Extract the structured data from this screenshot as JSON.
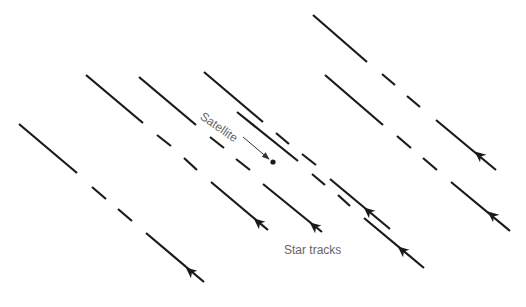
{
  "diagram": {
    "labels": {
      "satellite": "Satellite",
      "star_tracks": "Star tracks"
    },
    "colors": {
      "track": "#1a1a1a",
      "label": "#666666",
      "pointer": "#333333",
      "background": "#ffffff"
    },
    "star_tracks": [
      {
        "id": "A",
        "segments": [
          [
            19,
            124,
            77,
            173
          ],
          [
            92,
            187,
            106,
            199
          ],
          [
            118,
            209,
            132,
            221
          ],
          [
            146,
            233,
            204,
            282
          ]
        ],
        "arrow": [
          190,
          271
        ]
      },
      {
        "id": "B",
        "segments": [
          [
            86,
            75,
            143,
            123
          ],
          [
            157,
            135,
            171,
            146
          ],
          [
            184,
            158,
            197,
            170
          ],
          [
            211,
            182,
            268,
            230
          ]
        ],
        "arrow": [
          258,
          222
        ]
      },
      {
        "id": "C",
        "segments": [
          [
            139,
            77,
            196,
            125
          ],
          [
            210,
            137,
            224,
            148
          ],
          [
            236,
            159,
            250,
            170
          ],
          [
            263,
            184,
            322,
            232
          ]
        ],
        "arrow": [
          314,
          226
        ]
      },
      {
        "id": "D",
        "segments": [
          [
            204,
            72,
            263,
            122
          ],
          [
            276,
            133,
            289,
            144
          ],
          [
            302,
            154,
            316,
            165
          ],
          [
            330,
            179,
            390,
            229
          ]
        ],
        "arrow": [
          368,
          211
        ]
      },
      {
        "id": "E",
        "segments": [
          [
            313,
            15,
            367,
            62
          ],
          [
            382,
            74,
            395,
            85
          ],
          [
            407,
            96,
            420,
            107
          ],
          [
            436,
            120,
            496,
            170
          ]
        ],
        "arrow": [
          479,
          155
        ]
      },
      {
        "id": "F",
        "segments": [
          [
            325,
            75,
            383,
            125
          ],
          [
            397,
            136,
            411,
            148
          ],
          [
            423,
            158,
            437,
            170
          ],
          [
            451,
            182,
            510,
            231
          ]
        ],
        "arrow": [
          492,
          215
        ]
      },
      {
        "id": "G",
        "segments": [
          [
            312,
            174,
            325,
            185
          ],
          [
            338,
            195,
            350,
            206
          ],
          [
            364,
            218,
            424,
            268
          ]
        ],
        "arrow": [
          402,
          250
        ]
      }
    ],
    "satellite_track": [
      237,
      112,
      298,
      161
    ],
    "satellite_pointer": {
      "from": [
        243,
        137
      ],
      "to": [
        269,
        159
      ]
    },
    "satellite_dot": [
      273,
      162
    ]
  }
}
